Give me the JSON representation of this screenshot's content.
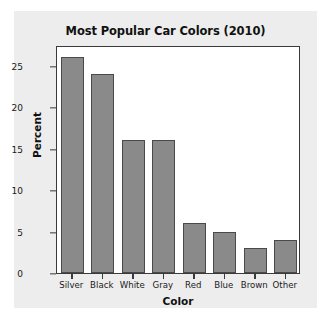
{
  "chart_data": {
    "type": "bar",
    "title": "Most Popular Car Colors (2010)",
    "xlabel": "Color",
    "ylabel": "Percent",
    "categories": [
      "Silver",
      "Black",
      "White",
      "Gray",
      "Red",
      "Blue",
      "Brown",
      "Other"
    ],
    "values": [
      26,
      24,
      16,
      16,
      6,
      5,
      3,
      4
    ],
    "ylim": [
      0,
      27.5
    ],
    "yticks": [
      0,
      5,
      10,
      15,
      20,
      25
    ],
    "ytick_labels": [
      "0",
      "5",
      "10",
      "15",
      "20",
      "25"
    ],
    "grid": false,
    "legend": false,
    "legend_position": "none",
    "bar_color": "#8a8a8a",
    "bar_edge_color": "#4a4a4a",
    "panel_color": "#ededed",
    "plot_background": "#ffffff",
    "axis_color": "#3a3a3a",
    "text_color": "#111111"
  }
}
